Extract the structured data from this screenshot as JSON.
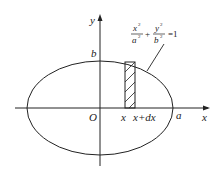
{
  "figure": {
    "axes": {
      "x_label": "x",
      "y_label": "y",
      "origin_label": "O"
    },
    "ellipse": {
      "a_label": "a",
      "b_label": "b",
      "equation": {
        "x_num": "x",
        "x_exp": "2",
        "x_den": "a",
        "x_den_exp": "2",
        "plus": "+",
        "y_num": "y",
        "y_exp": "2",
        "y_den": "b",
        "y_den_exp": "2",
        "equals": "=1"
      }
    },
    "strip": {
      "left_label": "x",
      "right_label": "x+dx"
    }
  }
}
